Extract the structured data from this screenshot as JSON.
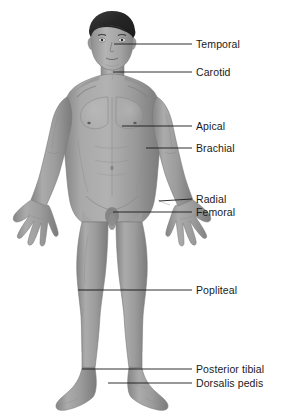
{
  "figure": {
    "orientation": "anterior",
    "render_style": "grayscale medical illustration"
  },
  "colors": {
    "background": "#ffffff",
    "skin_base": "#9e9e9e",
    "skin_light": "#b8b8b8",
    "skin_mid": "#989898",
    "skin_shadow": "#7d7d7d",
    "skin_deep_shadow": "#666666",
    "hair": "#2e2e2e",
    "hair_highlight": "#4a4a4a",
    "outline": "#6f6f6f",
    "leader_line": "#1a1a1a",
    "label_text": "#1a1a1a"
  },
  "labels": [
    {
      "id": "temporal",
      "text": "Temporal",
      "text_x": 196,
      "text_y": 44,
      "line_x1": 114,
      "line_y1": 44,
      "line_x2": 192,
      "line_y2": 44
    },
    {
      "id": "carotid",
      "text": "Carotid",
      "text_x": 196,
      "text_y": 72,
      "line_x1": 113,
      "line_y1": 72,
      "line_x2": 192,
      "line_y2": 72
    },
    {
      "id": "apical",
      "text": "Apical",
      "text_x": 196,
      "text_y": 126,
      "line_x1": 122,
      "line_y1": 126,
      "line_x2": 192,
      "line_y2": 126
    },
    {
      "id": "brachial",
      "text": "Brachial",
      "text_x": 196,
      "text_y": 148,
      "line_x1": 146,
      "line_y1": 148,
      "line_x2": 192,
      "line_y2": 148
    },
    {
      "id": "radial",
      "text": "Radial",
      "text_x": 196,
      "text_y": 199,
      "line_x1": 159,
      "line_y1": 201,
      "line_x2": 192,
      "line_y2": 199
    },
    {
      "id": "femoral",
      "text": "Femoral",
      "text_x": 196,
      "text_y": 212,
      "line_x1": 113,
      "line_y1": 212,
      "line_x2": 192,
      "line_y2": 212
    },
    {
      "id": "popliteal",
      "text": "Popliteal",
      "text_x": 196,
      "text_y": 290,
      "line_x1": 78,
      "line_y1": 290,
      "line_x2": 192,
      "line_y2": 290
    },
    {
      "id": "posterior-tibial",
      "text": "Posterior tibial",
      "text_x": 196,
      "text_y": 369,
      "line_x1": 82,
      "line_y1": 369,
      "line_x2": 192,
      "line_y2": 369
    },
    {
      "id": "dorsalis-pedis",
      "text": "Dorsalis pedis",
      "text_x": 196,
      "text_y": 383,
      "line_x1": 108,
      "line_y1": 383,
      "line_x2": 192,
      "line_y2": 383
    }
  ]
}
